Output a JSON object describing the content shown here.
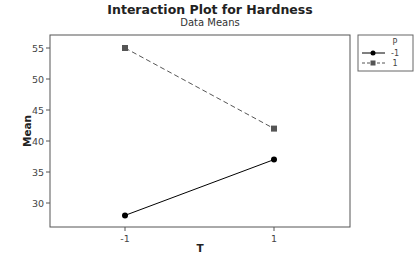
{
  "chart_data": {
    "type": "line",
    "title": "Interaction Plot for Hardness",
    "subtitle": "Data Means",
    "xlabel": "T",
    "ylabel": "Mean",
    "categories": [
      "-1",
      "1"
    ],
    "yticks": [
      30,
      35,
      40,
      45,
      50,
      55
    ],
    "ylim": [
      26.2,
      56.6
    ],
    "legend": {
      "title": "P",
      "position": "right"
    },
    "series": [
      {
        "name": "-1",
        "values": [
          28,
          37
        ],
        "marker": "circle",
        "linestyle": "solid",
        "color": "#000000"
      },
      {
        "name": "1",
        "values": [
          55,
          42
        ],
        "marker": "square",
        "linestyle": "dashed",
        "color": "#555555"
      }
    ],
    "grid": false
  }
}
